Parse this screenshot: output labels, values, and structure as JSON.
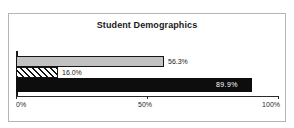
{
  "chart_data": {
    "type": "bar",
    "orientation": "horizontal",
    "title": "Student Demographics",
    "xlabel": "",
    "ylabel": "",
    "categories": [
      "series-1",
      "series-2",
      "series-3"
    ],
    "values": [
      56.3,
      16.0,
      89.9
    ],
    "data_labels": [
      "56.3%",
      "16.0%",
      "89.9%"
    ],
    "xlim": [
      0,
      100
    ],
    "x_ticks": [
      0,
      50,
      100
    ],
    "x_tick_labels": [
      "0%",
      "50%",
      "100%"
    ],
    "grid": false,
    "legend": false,
    "bars": [
      {
        "label": "56.3%",
        "value": 56.3,
        "style": "fill-grey",
        "label_position": "outside",
        "color": "#c2c2c2"
      },
      {
        "label": "16.0%",
        "value": 16.0,
        "style": "fill-hatch",
        "label_position": "outside",
        "color": "#ffffff"
      },
      {
        "label": "89.9%",
        "value": 89.9,
        "style": "fill-black",
        "label_position": "inside",
        "color": "#0d0d0d"
      }
    ]
  },
  "colors": {
    "background": "#ffffff",
    "frame": "#b5b5b5",
    "axis": "#2a2a2a",
    "text": "#1a1a1a",
    "bar_grey": "#c2c2c2",
    "bar_black": "#0d0d0d",
    "label_inside": "#ffffff"
  }
}
